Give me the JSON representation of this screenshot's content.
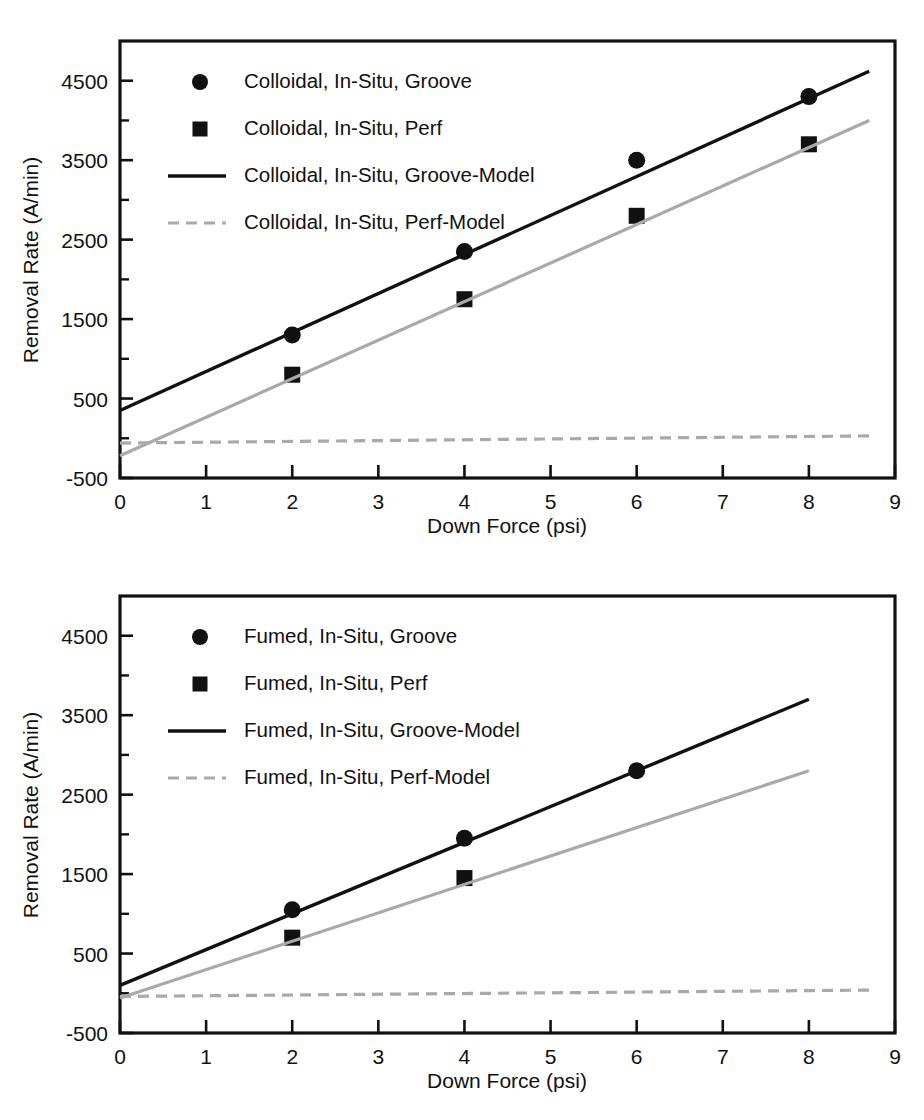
{
  "figure": {
    "panels": [
      "colloidal",
      "fumed"
    ]
  },
  "chart_data": [
    {
      "id": "colloidal",
      "type": "scatter",
      "title": "",
      "xlabel": "Down Force (psi)",
      "ylabel": "Removal Rate (A/min)",
      "xlim": [
        0,
        9
      ],
      "ylim": [
        -500,
        5000
      ],
      "xticks": [
        0,
        1,
        2,
        3,
        4,
        5,
        6,
        7,
        8,
        9
      ],
      "xticklabels": [
        "0",
        "1",
        "2",
        "3",
        "4",
        "5",
        "6",
        "7",
        "8",
        "9"
      ],
      "yticks": [
        -500,
        500,
        1500,
        2500,
        3500,
        4500
      ],
      "yticklabels": [
        "-500",
        "500",
        "1500",
        "2500",
        "3500",
        "4500"
      ],
      "yminorticks": [
        0,
        1000,
        2000,
        3000,
        4000
      ],
      "grid": false,
      "legend_position": "upper-left-inside",
      "series": [
        {
          "name": "Colloidal, In-Situ, Groove",
          "marker": "circle",
          "color": "#111111",
          "kind": "points",
          "x": [
            2,
            4,
            6,
            8
          ],
          "values": [
            1300,
            2350,
            3500,
            4300
          ]
        },
        {
          "name": "Colloidal, In-Situ, Perf",
          "marker": "square",
          "color": "#111111",
          "kind": "points",
          "x": [
            2,
            4,
            6,
            8
          ],
          "values": [
            800,
            1750,
            2800,
            3700
          ]
        },
        {
          "name": "Colloidal, In-Situ, Groove-Model",
          "marker": "solid-line",
          "color": "#111111",
          "kind": "line",
          "x": [
            0,
            8.7
          ],
          "values": [
            350,
            4620
          ]
        },
        {
          "name": "Colloidal, In-Situ, Perf-Model",
          "marker": "dashed-line",
          "color": "#a9a9a9",
          "kind": "line",
          "x": [
            0,
            8.7
          ],
          "values": [
            -60,
            30
          ]
        },
        {
          "name": "Colloidal, In-Situ, Perf-Fit",
          "marker": "solid-line",
          "color": "#a9a9a9",
          "kind": "line",
          "x": [
            0,
            8.7
          ],
          "values": [
            -220,
            4000
          ]
        }
      ]
    },
    {
      "id": "fumed",
      "type": "scatter",
      "title": "",
      "xlabel": "Down Force (psi)",
      "ylabel": "Removal Rate (A/min)",
      "xlim": [
        0,
        9
      ],
      "ylim": [
        -500,
        5000
      ],
      "xticks": [
        0,
        1,
        2,
        3,
        4,
        5,
        6,
        7,
        8,
        9
      ],
      "xticklabels": [
        "0",
        "1",
        "2",
        "3",
        "4",
        "5",
        "6",
        "7",
        "8",
        "9"
      ],
      "yticks": [
        -500,
        500,
        1500,
        2500,
        3500,
        4500
      ],
      "yticklabels": [
        "-500",
        "500",
        "1500",
        "2500",
        "3500",
        "4500"
      ],
      "yminorticks": [
        0,
        1000,
        2000,
        3000,
        4000
      ],
      "grid": false,
      "legend_position": "upper-left-inside",
      "series": [
        {
          "name": "Fumed, In-Situ, Groove",
          "marker": "circle",
          "color": "#111111",
          "kind": "points",
          "x": [
            2,
            4,
            6
          ],
          "values": [
            1050,
            1950,
            2800
          ]
        },
        {
          "name": "Fumed, In-Situ, Perf",
          "marker": "square",
          "color": "#111111",
          "kind": "points",
          "x": [
            2,
            4
          ],
          "values": [
            700,
            1450
          ]
        },
        {
          "name": "Fumed, In-Situ, Groove-Model",
          "marker": "solid-line",
          "color": "#111111",
          "kind": "line",
          "x": [
            0,
            8
          ],
          "values": [
            100,
            3700
          ]
        },
        {
          "name": "Fumed, In-Situ, Perf-Model",
          "marker": "dashed-line",
          "color": "#a9a9a9",
          "kind": "line",
          "x": [
            0,
            8.7
          ],
          "values": [
            -40,
            40
          ]
        },
        {
          "name": "Fumed, In-Situ, Perf-Fit",
          "marker": "solid-line",
          "color": "#a9a9a9",
          "kind": "line",
          "x": [
            0,
            8
          ],
          "values": [
            -60,
            2800
          ]
        }
      ]
    }
  ],
  "legends": {
    "colloidal": [
      {
        "label": "Colloidal, In-Situ, Groove",
        "glyph": "circle"
      },
      {
        "label": "Colloidal, In-Situ, Perf",
        "glyph": "square"
      },
      {
        "label": "Colloidal, In-Situ, Groove-Model",
        "glyph": "solid-line"
      },
      {
        "label": "Colloidal, In-Situ, Perf-Model",
        "glyph": "dashed-line"
      }
    ],
    "fumed": [
      {
        "label": "Fumed, In-Situ, Groove",
        "glyph": "circle"
      },
      {
        "label": "Fumed, In-Situ, Perf",
        "glyph": "square"
      },
      {
        "label": "Fumed, In-Situ, Groove-Model",
        "glyph": "solid-line"
      },
      {
        "label": "Fumed, In-Situ, Perf-Model",
        "glyph": "dashed-line"
      }
    ]
  },
  "colors": {
    "ink": "#111111",
    "grey_series": "#a9a9a9",
    "background": "#ffffff"
  }
}
